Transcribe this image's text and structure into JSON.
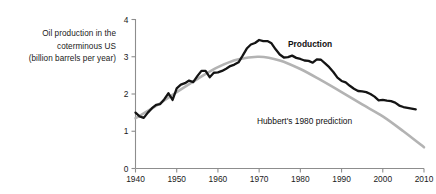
{
  "figure": {
    "caption_lines": [
      "Oil production in the",
      "coterminous US",
      "(billion barrels per year)"
    ]
  },
  "chart_data": {
    "type": "line",
    "title": "Oil production in the coterminous US (billion barrels per year)",
    "xlabel": "",
    "ylabel": "Oil production in the coterminous US (billion barrels per year)",
    "xlim": [
      1940,
      2010
    ],
    "ylim": [
      0,
      4
    ],
    "xticks": [
      1940,
      1950,
      1960,
      1970,
      1980,
      1990,
      2000,
      2010
    ],
    "yticks": [
      0,
      1,
      2,
      3,
      4
    ],
    "xtick_labels": [
      "1940",
      "1950",
      "1960",
      "1970",
      "1980",
      "1990",
      "2000",
      "2010"
    ],
    "ytick_labels": [
      "0",
      "1",
      "2",
      "3",
      "4"
    ],
    "grid": false,
    "legend": "inline-annotations",
    "annotations": [
      {
        "text": "Production",
        "series": "production",
        "x": 1977,
        "y": 3.25,
        "bold": true,
        "color": "#141414"
      },
      {
        "text": "Hubbert's 1980 prediction",
        "series": "prediction",
        "x": 1981,
        "y": 1.2,
        "bold": false,
        "color": "#333333"
      }
    ],
    "series": [
      {
        "name": "Production",
        "color": "#141414",
        "style": "solid",
        "x": [
          1940,
          1941,
          1942,
          1943,
          1944,
          1945,
          1946,
          1947,
          1948,
          1949,
          1950,
          1951,
          1952,
          1953,
          1954,
          1955,
          1956,
          1957,
          1958,
          1959,
          1960,
          1961,
          1962,
          1963,
          1964,
          1965,
          1966,
          1967,
          1968,
          1969,
          1970,
          1971,
          1972,
          1973,
          1974,
          1975,
          1976,
          1977,
          1978,
          1979,
          1980,
          1981,
          1982,
          1983,
          1984,
          1985,
          1986,
          1987,
          1988,
          1989,
          1990,
          1991,
          1992,
          1993,
          1994,
          1995,
          1996,
          1997,
          1998,
          1999,
          2000,
          2001,
          2002,
          2003,
          2004,
          2005,
          2006,
          2007,
          2008
        ],
        "values": [
          1.5,
          1.4,
          1.36,
          1.5,
          1.62,
          1.71,
          1.73,
          1.86,
          2.02,
          1.84,
          2.15,
          2.25,
          2.29,
          2.36,
          2.32,
          2.48,
          2.62,
          2.62,
          2.45,
          2.57,
          2.58,
          2.62,
          2.68,
          2.75,
          2.79,
          2.85,
          3.03,
          3.22,
          3.33,
          3.37,
          3.45,
          3.42,
          3.42,
          3.36,
          3.2,
          3.06,
          2.98,
          2.99,
          3.03,
          2.97,
          2.94,
          2.9,
          2.89,
          2.84,
          2.93,
          2.92,
          2.82,
          2.72,
          2.59,
          2.44,
          2.35,
          2.31,
          2.22,
          2.14,
          2.08,
          2.07,
          2.05,
          2.0,
          1.93,
          1.83,
          1.84,
          1.82,
          1.81,
          1.77,
          1.69,
          1.65,
          1.63,
          1.61,
          1.59
        ]
      },
      {
        "name": "Hubbert's 1980 prediction",
        "color": "#b3b3b3",
        "style": "solid",
        "x": [
          1940,
          1945,
          1950,
          1955,
          1960,
          1965,
          1970,
          1975,
          1980,
          1985,
          1990,
          1995,
          2000,
          2005,
          2010
        ],
        "values": [
          1.35,
          1.68,
          2.05,
          2.4,
          2.72,
          2.93,
          3.0,
          2.9,
          2.67,
          2.37,
          2.05,
          1.72,
          1.4,
          1.0,
          0.57
        ]
      }
    ]
  }
}
